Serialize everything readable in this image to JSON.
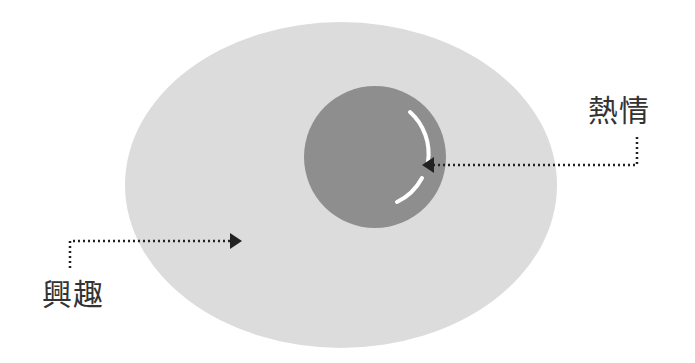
{
  "diagram": {
    "outer": {
      "label": "興趣",
      "color": "#dcdcdc"
    },
    "inner": {
      "label": "熱情",
      "color": "#8e8e8e",
      "highlight_color": "#ffffff"
    },
    "arrow_color": "#222222"
  }
}
